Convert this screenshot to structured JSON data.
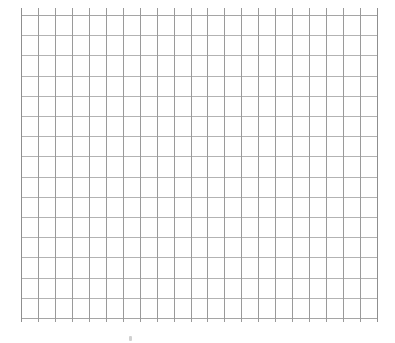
{
  "page": {
    "kind": "grid-sheet",
    "width": 395,
    "height": 343,
    "background_color": "#ffffff",
    "caption": ""
  },
  "grid": {
    "name": "graph-paper-grid",
    "origin_x": 21,
    "origin_y": 15,
    "width": 356,
    "height": 303,
    "columns": 21,
    "rows": 15,
    "cell_width": 16.95,
    "cell_height": 20.2,
    "vertical_line_count": 22,
    "horizontal_line_count": 16,
    "vertical_line_color": "#9a9a9a",
    "horizontal_line_color": "#b3b3b3",
    "edge_line_color": "#8f8f8f",
    "tick_overhang_top": 7,
    "tick_overhang_bottom": 4,
    "line_width": 1
  },
  "artifact": {
    "name": "scan-speck",
    "x": 129,
    "y": 336,
    "width": 3,
    "height": 5,
    "color": "#c9c9c9",
    "label": ""
  },
  "chart_data": {
    "type": "table",
    "title": "",
    "subtitle": "",
    "xlabel": "",
    "ylabel": "",
    "legend": [],
    "annotations": [],
    "grid": true,
    "series": [],
    "categories": [],
    "values": []
  }
}
